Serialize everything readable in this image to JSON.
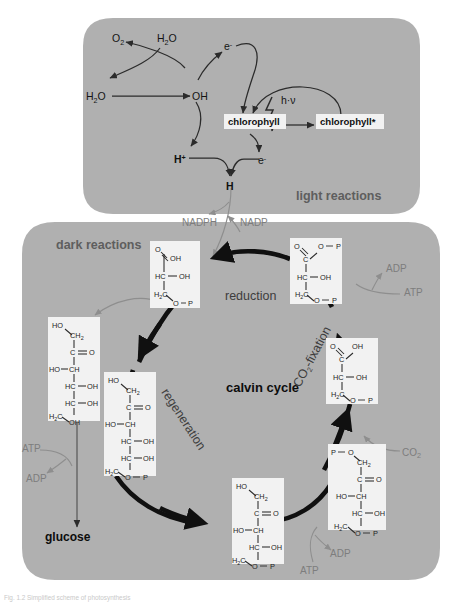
{
  "figure": {
    "caption": "Fig. 1.2  Simplified scheme of photosynthesis",
    "background_color": "#ffffff",
    "panel_color": "#b0b0b0",
    "molecule_box_color": "#f2f2f2"
  },
  "panels": {
    "light": {
      "label": "light reactions"
    },
    "dark": {
      "label": "dark reactions"
    }
  },
  "light_reactions": {
    "species": {
      "o2": "O",
      "o2_sub": "2",
      "h2o_top": "H",
      "h2o_top_sub": "2",
      "h2o_top_tail": "O",
      "h2o_left": "H",
      "h2o_left_sub": "2",
      "h2o_left_tail": "O",
      "oh": "OH",
      "electron_top": "e",
      "electron_top_sup": "-",
      "electron_low": "e",
      "electron_low_sup": "-",
      "proton": "H",
      "proton_sup": "+",
      "hydrogen": "H",
      "photon": "h·ν"
    },
    "boxes": {
      "chlorophyll": "chlorophyll",
      "chlorophyll_excited": "chlorophyll*"
    }
  },
  "cofactors": {
    "nadph": "NADPH",
    "nadp": "NADP",
    "atp_right": "ATP",
    "adp_right": "ADP",
    "atp_bottom": "ATP",
    "adp_bottom": "ADP",
    "atp_left": "ATP",
    "adp_left": "ADP",
    "co2": "CO",
    "co2_sub": "2"
  },
  "calvin": {
    "title": "calvin cycle",
    "steps": {
      "reduction": "reduction",
      "co2_fixation": "CO₂-fixation",
      "regeneration": "regeneration"
    },
    "product": "glucose"
  },
  "molecules": [
    {
      "id": "glyceraldehyde-3-phosphate",
      "position": "cycle-top-left",
      "atoms": [
        "O",
        "OH",
        "HC",
        "OH",
        "H",
        "C",
        "O",
        "P"
      ],
      "subscripts": [
        "2"
      ]
    },
    {
      "id": "1,3-bisphosphoglycerate",
      "position": "cycle-top-right",
      "atoms": [
        "O",
        "O",
        "P",
        "C",
        "HC",
        "OH",
        "H",
        "C",
        "O",
        "P"
      ],
      "subscripts": [
        "2"
      ]
    },
    {
      "id": "3-phosphoglycerate",
      "position": "cycle-right",
      "atoms": [
        "O",
        "OH",
        "C",
        "HC",
        "OH",
        "H",
        "C",
        "O",
        "P"
      ],
      "subscripts": [
        "2"
      ]
    },
    {
      "id": "ribulose-1,5-bisphosphate",
      "position": "cycle-bottom-right",
      "atoms": [
        "P",
        "O",
        "CH",
        "C",
        "O",
        "HO",
        "CH",
        "HC",
        "OH",
        "H",
        "C",
        "O",
        "P"
      ],
      "subscripts": [
        "2",
        "2"
      ]
    },
    {
      "id": "ribulose-5-phosphate",
      "position": "cycle-bottom",
      "atoms": [
        "HO",
        "CH",
        "C",
        "O",
        "HO",
        "CH",
        "HC",
        "OH",
        "H",
        "C",
        "O",
        "P"
      ],
      "subscripts": [
        "2",
        "2"
      ]
    },
    {
      "id": "fructose-6-phosphate",
      "position": "cycle-left",
      "atoms": [
        "HO",
        "CH",
        "C",
        "O",
        "HO",
        "CH",
        "HC",
        "OH",
        "HC",
        "OH",
        "H",
        "C",
        "O",
        "P"
      ],
      "subscripts": [
        "2",
        "2"
      ]
    },
    {
      "id": "fructose",
      "position": "outer-left",
      "atoms": [
        "HO",
        "CH",
        "C",
        "O",
        "HO",
        "CH",
        "HC",
        "OH",
        "HC",
        "OH",
        "H",
        "C",
        "OH"
      ],
      "subscripts": [
        "2",
        "2"
      ]
    }
  ]
}
